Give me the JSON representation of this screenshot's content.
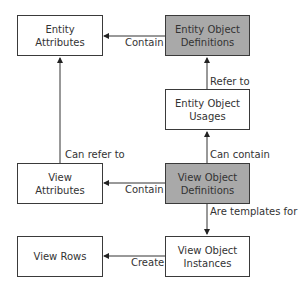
{
  "diagram": {
    "nodes": {
      "entity_attributes": {
        "line1": "Entity",
        "line2": "Attributes",
        "shaded": false
      },
      "entity_object_definitions": {
        "line1": "Entity Object",
        "line2": "Definitions",
        "shaded": true
      },
      "entity_object_usages": {
        "line1": "Entity Object",
        "line2": "Usages",
        "shaded": false
      },
      "view_attributes": {
        "line1": "View",
        "line2": "Attributes",
        "shaded": false
      },
      "view_object_definitions": {
        "line1": "View Object",
        "line2": "Definitions",
        "shaded": true
      },
      "view_rows": {
        "line1": "View Rows",
        "shaded": false
      },
      "view_object_instances": {
        "line1": "View Object",
        "line2": "Instances",
        "shaded": false
      }
    },
    "edges": [
      {
        "from": "entity_object_definitions",
        "to": "entity_attributes",
        "label": "Contain"
      },
      {
        "from": "entity_object_usages",
        "to": "entity_object_definitions",
        "label": "Refer to"
      },
      {
        "from": "view_object_definitions",
        "to": "entity_object_usages",
        "label": "Can contain"
      },
      {
        "from": "view_attributes",
        "to": "entity_attributes",
        "label": "Can refer to"
      },
      {
        "from": "view_object_definitions",
        "to": "view_attributes",
        "label": "Contain"
      },
      {
        "from": "view_object_definitions",
        "to": "view_object_instances",
        "label": "Are templates for"
      },
      {
        "from": "view_object_instances",
        "to": "view_rows",
        "label": "Create"
      }
    ],
    "colors": {
      "shaded": "#a9a9a9",
      "border": "#3a3a3a",
      "line": "#333333"
    }
  }
}
